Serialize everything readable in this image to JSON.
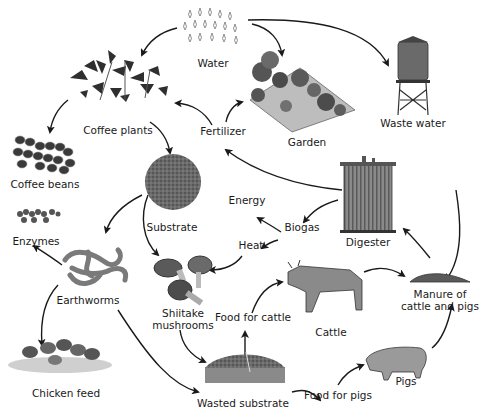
{
  "diagram": {
    "type": "cycle-flow",
    "theme_color": "#1a1a1a",
    "nodes": {
      "water": {
        "label": "Water",
        "icon": "water-drops-icon"
      },
      "garden": {
        "label": "Garden",
        "icon": "garden-icon"
      },
      "waste_water": {
        "label": "Waste water",
        "icon": "water-tower-icon"
      },
      "coffee_plants": {
        "label": "Coffee plants",
        "icon": "coffee-plant-icon"
      },
      "fertilizer": {
        "label": "Fertilizer"
      },
      "coffee_beans": {
        "label": "Coffee beans",
        "icon": "coffee-beans-icon"
      },
      "substrate": {
        "label": "Substrate",
        "icon": "substrate-icon"
      },
      "energy": {
        "label": "Energy"
      },
      "biogas": {
        "label": "Biogas"
      },
      "heat": {
        "label": "Heat"
      },
      "digester": {
        "label": "Digester",
        "icon": "digester-tank-icon"
      },
      "enzymes": {
        "label": "Enzymes",
        "icon": "enzymes-icon"
      },
      "earthworms": {
        "label": "Earthworms",
        "icon": "earthworms-icon"
      },
      "shiitake": {
        "label": "Shiitake mushrooms",
        "icon": "mushroom-icon"
      },
      "food_for_cattle": {
        "label": "Food for cattle"
      },
      "cattle": {
        "label": "Cattle",
        "icon": "cow-icon"
      },
      "manure": {
        "label": "Manure of cattle and pigs",
        "icon": "manure-icon"
      },
      "chicken_feed": {
        "label": "Chicken feed",
        "icon": "chickens-icon"
      },
      "wasted_substrate": {
        "label": "Wasted substrate",
        "icon": "wasted-substrate-icon"
      },
      "food_for_pigs": {
        "label": "Food for pigs"
      },
      "pigs": {
        "label": "Pigs",
        "icon": "pig-icon"
      }
    },
    "edges": [
      [
        "Water",
        "Coffee plants"
      ],
      [
        "Water",
        "Garden"
      ],
      [
        "Water",
        "Waste water"
      ],
      [
        "Coffee plants",
        "Coffee beans"
      ],
      [
        "Coffee plants",
        "Substrate"
      ],
      [
        "Fertilizer",
        "Coffee plants"
      ],
      [
        "Fertilizer",
        "Garden"
      ],
      [
        "Digester",
        "Fertilizer"
      ],
      [
        "Digester",
        "Biogas"
      ],
      [
        "Biogas",
        "Energy"
      ],
      [
        "Biogas",
        "Heat"
      ],
      [
        "Heat",
        "Shiitake mushrooms"
      ],
      [
        "Waste water",
        "Manure of cattle and pigs"
      ],
      [
        "Manure of cattle and pigs",
        "Digester"
      ],
      [
        "Substrate",
        "Earthworms"
      ],
      [
        "Substrate",
        "Shiitake mushrooms"
      ],
      [
        "Earthworms",
        "Enzymes"
      ],
      [
        "Earthworms",
        "Chicken feed"
      ],
      [
        "Earthworms",
        "Wasted substrate"
      ],
      [
        "Shiitake mushrooms",
        "Wasted substrate"
      ],
      [
        "Wasted substrate",
        "Food for cattle"
      ],
      [
        "Food for cattle",
        "Cattle"
      ],
      [
        "Cattle",
        "Manure of cattle and pigs"
      ],
      [
        "Wasted substrate",
        "Food for pigs"
      ],
      [
        "Food for pigs",
        "Pigs"
      ],
      [
        "Pigs",
        "Manure of cattle and pigs"
      ]
    ]
  }
}
